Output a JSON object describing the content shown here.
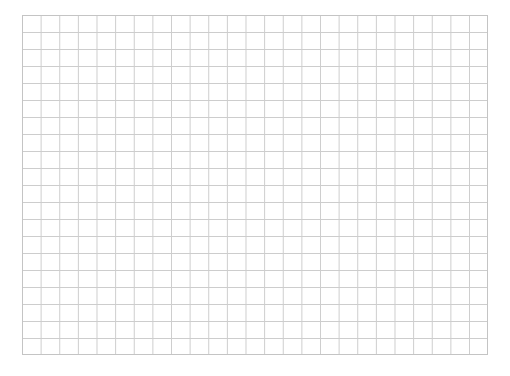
{
  "grid": {
    "columns": 25,
    "rows": 20,
    "line_color": "#cdcdcd",
    "border_color": "#c4c4c4",
    "background": "#ffffff"
  }
}
